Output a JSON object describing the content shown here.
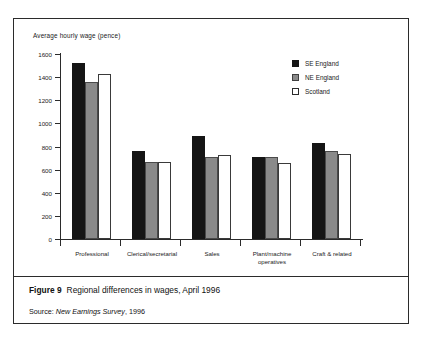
{
  "figure": {
    "number_label": "Figure 9",
    "title": "Regional differences in wages, April 1996",
    "source_prefix": "Source:",
    "source_italic": "New Earnings Survey",
    "source_suffix": ", 1996"
  },
  "colors": {
    "se_england": "#151515",
    "ne_england": "#8a8a8a",
    "scotland": "#ffffff",
    "axis": "#2b2b2b",
    "text": "#1a1a1a"
  },
  "chart_data": {
    "type": "bar",
    "title": "Regional differences in wages, April 1996",
    "xlabel": "",
    "ylabel": "Average hourly wage (pence)",
    "ylim": [
      0,
      1600
    ],
    "ytick_step": 200,
    "yticks": [
      1600,
      1400,
      1200,
      1000,
      800,
      600,
      400,
      200,
      0
    ],
    "ytick_labels": [
      "1600",
      "1400",
      "1200",
      "1000",
      "800",
      "600",
      "400",
      "200",
      "0"
    ],
    "grid": false,
    "legend_position": "top-right",
    "categories": [
      "Professional",
      "Clerical/secretarial",
      "Sales",
      "Plant/machine operatives",
      "Craft & related"
    ],
    "category_label_lines": [
      [
        "Professional"
      ],
      [
        "Clerical/secretarial"
      ],
      [
        "Sales"
      ],
      [
        "Plant/machine",
        "operatives"
      ],
      [
        "Craft & related"
      ]
    ],
    "series": [
      {
        "name": "SE England",
        "swatch": "se",
        "color": "#151515",
        "values": [
          1520,
          760,
          890,
          710,
          830
        ]
      },
      {
        "name": "NE England",
        "swatch": "ne",
        "color": "#8a8a8a",
        "values": [
          1355,
          665,
          710,
          705,
          765
        ]
      },
      {
        "name": "Scotland",
        "swatch": "sc",
        "color": "#ffffff",
        "values": [
          1425,
          665,
          730,
          655,
          735
        ]
      }
    ]
  }
}
